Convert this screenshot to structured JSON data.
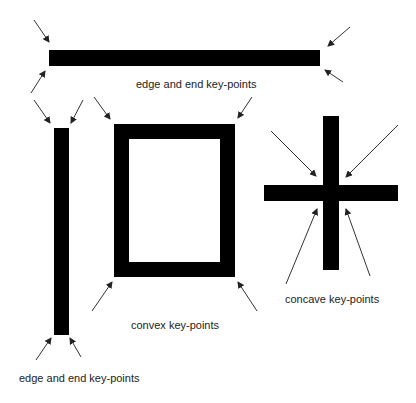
{
  "diagram": {
    "type": "key-point illustration",
    "labels": {
      "top_bar": "edge and end key-points",
      "vertical_bar": "edge and end key-points",
      "frame": "convex key-points",
      "cross": "concave key-points"
    },
    "shapes": [
      {
        "id": "horizontal-bar",
        "kind": "bar",
        "arrows": 4
      },
      {
        "id": "vertical-bar",
        "kind": "bar",
        "arrows": 4
      },
      {
        "id": "rectangle-frame",
        "kind": "frame",
        "arrows": 4
      },
      {
        "id": "cross",
        "kind": "cross",
        "arrows": 4
      }
    ],
    "colors": {
      "shape": "#000000",
      "arrow": "#333333",
      "background": "#ffffff"
    }
  }
}
